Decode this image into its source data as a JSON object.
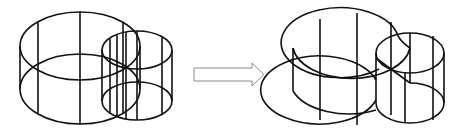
{
  "diagram": {
    "colors": {
      "stroke": "#111111",
      "arrow_stroke": "#8a8a8a",
      "background": "#ffffff"
    },
    "left_figure": {
      "label": "two-overlapping-cylinders"
    },
    "arrow": {
      "label": "transform-arrow"
    },
    "right_figure": {
      "label": "merged-cylinder-union"
    }
  }
}
